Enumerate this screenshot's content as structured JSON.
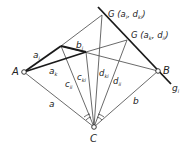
{
  "points": {
    "A": {
      "label": "A",
      "x": 24,
      "y": 72
    },
    "B": {
      "label": "B",
      "x": 158,
      "y": 71
    },
    "C": {
      "label": "C",
      "x": 94,
      "y": 127
    },
    "P1": {
      "x": 61,
      "y": 46
    },
    "P2": {
      "x": 86,
      "y": 52
    },
    "G1": {
      "x": 102,
      "y": 15
    },
    "G2": {
      "x": 127,
      "y": 40
    }
  },
  "labels": {
    "G1": "G (a",
    "G1_sub1": "i",
    "G1_mid": ", d",
    "G1_sub2": "ki",
    "G1_end": ")",
    "G2": "G (a",
    "G2_sub1": "k",
    "G2_mid": ", d",
    "G2_sub2": "ii",
    "G2_end": ")",
    "a_i": "a",
    "a_i_sub": "i",
    "a_k": "a",
    "a_k_sub": "k",
    "b_i": "b",
    "b_i_sub": "i",
    "c_ki": "c",
    "c_ki_sub": "ki",
    "c_ii": "c",
    "c_ii_sub": "ii",
    "d_ki": "d",
    "d_ki_sub": "ki",
    "d_ii": "d",
    "d_ii_sub": "ii",
    "a": "a",
    "b": "b",
    "g_i": "g",
    "g_i_sub": "i",
    "A": "A",
    "B": "B",
    "C": "C"
  },
  "colors": {
    "line": "#333333",
    "thick": "#1a1a1a",
    "bg": "#ffffff"
  }
}
